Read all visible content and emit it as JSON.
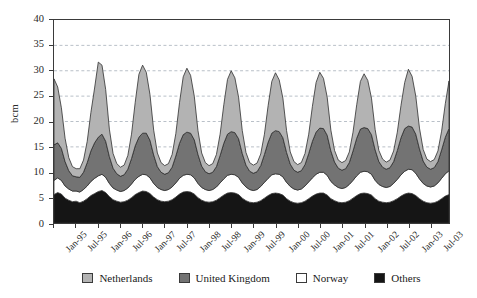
{
  "chart_data": {
    "type": "area",
    "stacked": true,
    "title": "",
    "subtitle": "",
    "xlabel": "",
    "ylabel": "bcm",
    "ylim": [
      0,
      40
    ],
    "ytick_values": [
      0,
      5,
      10,
      15,
      20,
      25,
      30,
      35,
      40
    ],
    "ytick_labels": [
      "0",
      "5",
      "10",
      "15",
      "20",
      "25",
      "30",
      "35",
      "40"
    ],
    "grid": true,
    "grid_axis": "y",
    "grid_style": "dashed",
    "legend_position": "bottom",
    "x_tick_labels": [
      "Jan-95",
      "Jul-95",
      "Jan-96",
      "Jul-96",
      "Jan-97",
      "Jul-97",
      "Jan-98",
      "Jul-98",
      "Jan-99",
      "Jul-99",
      "Jan-00",
      "Jul-00",
      "Jan-01",
      "Jul-01",
      "Jan-02",
      "Jul-02",
      "Jan-03",
      "Jul-03"
    ],
    "x_tick_interval_months": 6,
    "x": [
      "Jan-95",
      "Feb-95",
      "Mar-95",
      "Apr-95",
      "May-95",
      "Jun-95",
      "Jul-95",
      "Aug-95",
      "Sep-95",
      "Oct-95",
      "Nov-95",
      "Dec-95",
      "Jan-96",
      "Feb-96",
      "Mar-96",
      "Apr-96",
      "May-96",
      "Jun-96",
      "Jul-96",
      "Aug-96",
      "Sep-96",
      "Oct-96",
      "Nov-96",
      "Dec-96",
      "Jan-97",
      "Feb-97",
      "Mar-97",
      "Apr-97",
      "May-97",
      "Jun-97",
      "Jul-97",
      "Aug-97",
      "Sep-97",
      "Oct-97",
      "Nov-97",
      "Dec-97",
      "Jan-98",
      "Feb-98",
      "Mar-98",
      "Apr-98",
      "May-98",
      "Jun-98",
      "Jul-98",
      "Aug-98",
      "Sep-98",
      "Oct-98",
      "Nov-98",
      "Dec-98",
      "Jan-99",
      "Feb-99",
      "Mar-99",
      "Apr-99",
      "May-99",
      "Jun-99",
      "Jul-99",
      "Aug-99",
      "Sep-99",
      "Oct-99",
      "Nov-99",
      "Dec-99",
      "Jan-00",
      "Feb-00",
      "Mar-00",
      "Apr-00",
      "May-00",
      "Jun-00",
      "Jul-00",
      "Aug-00",
      "Sep-00",
      "Oct-00",
      "Nov-00",
      "Dec-00",
      "Jan-01",
      "Feb-01",
      "Mar-01",
      "Apr-01",
      "May-01",
      "Jun-01",
      "Jul-01",
      "Aug-01",
      "Sep-01",
      "Oct-01",
      "Nov-01",
      "Dec-01",
      "Jan-02",
      "Feb-02",
      "Mar-02",
      "Apr-02",
      "May-02",
      "Jun-02",
      "Jul-02",
      "Aug-02",
      "Sep-02",
      "Oct-02",
      "Nov-02",
      "Dec-02",
      "Jan-03",
      "Feb-03",
      "Mar-03",
      "Apr-03",
      "May-03",
      "Jun-03",
      "Jul-03",
      "Aug-03",
      "Sep-03",
      "Oct-03",
      "Nov-03",
      "Dec-03"
    ],
    "series": [
      {
        "name": "Others",
        "color": "#151515",
        "order": 1,
        "values": [
          5.6,
          6.0,
          5.7,
          4.9,
          4.5,
          4.2,
          4.3,
          4.0,
          4.3,
          4.8,
          5.4,
          5.8,
          6.2,
          6.4,
          6.0,
          5.2,
          4.6,
          4.3,
          4.1,
          4.2,
          4.5,
          5.0,
          5.6,
          6.0,
          6.3,
          6.2,
          5.8,
          5.1,
          4.6,
          4.3,
          4.2,
          4.3,
          4.6,
          5.1,
          5.7,
          6.1,
          6.2,
          6.1,
          5.7,
          5.0,
          4.5,
          4.2,
          4.1,
          4.2,
          4.5,
          5.0,
          5.5,
          5.9,
          6.0,
          5.9,
          5.6,
          4.9,
          4.4,
          4.1,
          4.0,
          4.1,
          4.4,
          4.9,
          5.4,
          5.8,
          5.9,
          5.8,
          5.5,
          4.8,
          4.3,
          4.0,
          3.9,
          4.0,
          4.3,
          4.8,
          5.3,
          5.7,
          5.9,
          5.9,
          5.5,
          4.8,
          4.4,
          4.1,
          4.0,
          4.1,
          4.4,
          4.9,
          5.4,
          5.8,
          5.9,
          5.8,
          5.5,
          4.8,
          4.3,
          4.1,
          4.0,
          4.1,
          4.4,
          4.8,
          5.3,
          5.7,
          5.9,
          5.8,
          5.4,
          4.8,
          4.3,
          4.0,
          3.9,
          4.0,
          4.3,
          4.8,
          5.3,
          5.6
        ]
      },
      {
        "name": "Norway",
        "color": "#ffffff",
        "order": 2,
        "values": [
          2.8,
          2.9,
          2.7,
          2.4,
          2.2,
          2.1,
          2.0,
          2.1,
          2.3,
          2.5,
          2.8,
          3.0,
          3.1,
          3.2,
          3.0,
          2.6,
          2.3,
          2.2,
          2.1,
          2.2,
          2.4,
          2.7,
          3.0,
          3.2,
          3.3,
          3.3,
          3.1,
          2.7,
          2.4,
          2.3,
          2.2,
          2.3,
          2.5,
          2.8,
          3.1,
          3.3,
          3.4,
          3.4,
          3.2,
          2.8,
          2.5,
          2.4,
          2.3,
          2.4,
          2.6,
          2.9,
          3.2,
          3.5,
          3.6,
          3.6,
          3.4,
          3.0,
          2.7,
          2.5,
          2.4,
          2.5,
          2.8,
          3.1,
          3.4,
          3.7,
          3.8,
          3.8,
          3.6,
          3.2,
          2.9,
          2.7,
          2.6,
          2.7,
          3.0,
          3.3,
          3.6,
          3.9,
          4.1,
          4.1,
          3.9,
          3.4,
          3.1,
          2.9,
          2.8,
          2.9,
          3.2,
          3.5,
          3.9,
          4.2,
          4.3,
          4.3,
          4.1,
          3.6,
          3.3,
          3.1,
          3.0,
          3.1,
          3.4,
          3.8,
          4.2,
          4.5,
          4.7,
          4.7,
          4.4,
          3.9,
          3.5,
          3.3,
          3.2,
          3.3,
          3.6,
          4.0,
          4.4,
          4.7
        ]
      },
      {
        "name": "United Kingdom",
        "color": "#737373",
        "order": 3,
        "values": [
          7.0,
          6.9,
          6.3,
          4.8,
          3.6,
          3.0,
          2.8,
          2.9,
          3.4,
          4.6,
          6.0,
          7.0,
          7.6,
          7.9,
          7.1,
          5.3,
          3.9,
          3.2,
          3.0,
          3.1,
          3.7,
          5.0,
          6.6,
          7.7,
          8.1,
          8.2,
          7.4,
          5.6,
          4.1,
          3.4,
          3.2,
          3.3,
          3.9,
          5.3,
          6.9,
          8.0,
          8.3,
          8.2,
          7.5,
          5.7,
          4.2,
          3.5,
          3.3,
          3.4,
          4.0,
          5.4,
          7.0,
          8.1,
          8.4,
          8.3,
          7.6,
          5.8,
          4.3,
          3.6,
          3.4,
          3.5,
          4.1,
          5.5,
          7.1,
          8.2,
          8.5,
          8.4,
          7.7,
          5.9,
          4.4,
          3.7,
          3.5,
          3.6,
          4.2,
          5.6,
          7.2,
          8.3,
          8.7,
          8.6,
          7.9,
          6.0,
          4.5,
          3.8,
          3.6,
          3.7,
          4.3,
          5.8,
          7.4,
          8.5,
          8.6,
          8.5,
          7.8,
          6.0,
          4.5,
          3.8,
          3.6,
          3.7,
          4.3,
          5.7,
          7.3,
          8.4,
          8.5,
          8.4,
          7.7,
          5.9,
          4.4,
          3.7,
          3.5,
          3.6,
          4.2,
          5.6,
          7.2,
          8.3
        ]
      },
      {
        "name": "Netherlands",
        "color": "#b3b3b3",
        "order": 4,
        "values": [
          13.0,
          11.0,
          8.0,
          4.6,
          2.6,
          1.8,
          1.6,
          1.7,
          2.4,
          4.2,
          7.6,
          10.8,
          14.8,
          13.6,
          10.2,
          5.4,
          2.9,
          2.0,
          1.8,
          1.9,
          2.7,
          4.8,
          8.6,
          12.4,
          13.4,
          12.0,
          9.0,
          4.9,
          2.7,
          1.9,
          1.7,
          1.8,
          2.5,
          4.4,
          8.0,
          11.4,
          12.6,
          11.4,
          8.6,
          4.7,
          2.6,
          1.8,
          1.6,
          1.7,
          2.4,
          4.2,
          7.6,
          10.8,
          12.0,
          10.8,
          8.2,
          4.5,
          2.5,
          1.7,
          1.6,
          1.7,
          2.3,
          4.0,
          7.2,
          10.2,
          11.4,
          10.2,
          7.8,
          4.3,
          2.4,
          1.7,
          1.5,
          1.6,
          2.2,
          3.8,
          6.9,
          9.8,
          11.0,
          9.9,
          7.5,
          4.1,
          2.3,
          1.6,
          1.5,
          1.6,
          2.1,
          3.7,
          6.6,
          9.4,
          10.6,
          9.5,
          7.2,
          4.0,
          2.2,
          1.6,
          1.4,
          1.5,
          2.1,
          3.6,
          6.4,
          9.1,
          11.2,
          10.0,
          7.5,
          4.1,
          2.3,
          1.6,
          1.5,
          1.6,
          2.1,
          3.7,
          6.6,
          9.4
        ]
      }
    ],
    "legend": [
      {
        "label": "Netherlands",
        "color": "#b3b3b3"
      },
      {
        "label": "United Kingdom",
        "color": "#737373"
      },
      {
        "label": "Norway",
        "color": "#ffffff"
      },
      {
        "label": "Others",
        "color": "#151515"
      }
    ]
  }
}
